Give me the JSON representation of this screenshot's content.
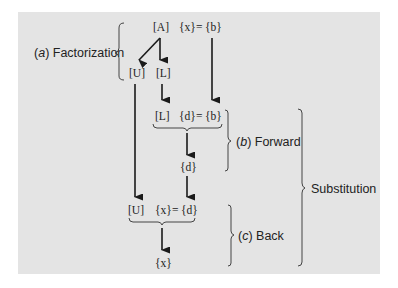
{
  "diagram": {
    "stages": {
      "factorization": {
        "prefix": "(",
        "letter": "a",
        "suffix": ") Factorization"
      },
      "forward": {
        "prefix": "(",
        "letter": "b",
        "suffix": ") Forward"
      },
      "back": {
        "prefix": "(",
        "letter": "c",
        "suffix": ") Back"
      },
      "substitution": "Substitution"
    },
    "nodes": {
      "A": "[A]",
      "x_eq_b_top": {
        "lhs": "{x}",
        "eq": "=",
        "rhs": "{b}"
      },
      "U1": "[U]",
      "L1": "[L]",
      "L2": "[L]",
      "d_eq_b": {
        "lhs": "{d}",
        "eq": "=",
        "rhs": "{b}"
      },
      "d": "{d}",
      "U2": "[U]",
      "x_eq_d": {
        "lhs": "{x}",
        "eq": "=",
        "rhs": "{d}"
      },
      "x": "{x}"
    },
    "colors": {
      "panel": "#e4e4e4",
      "ink": "#1a1a1a"
    }
  }
}
